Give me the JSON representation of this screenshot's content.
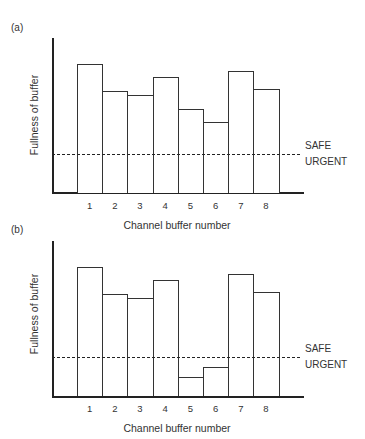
{
  "chart_data": [
    {
      "type": "bar",
      "panel": "(a)",
      "title": "",
      "xlabel": "Channel buffer number",
      "ylabel": "Fullness of buffer",
      "categories": [
        "1",
        "2",
        "3",
        "4",
        "5",
        "6",
        "7",
        "8"
      ],
      "values": [
        83,
        66,
        63,
        75,
        54,
        46,
        79,
        67
      ],
      "ylim": [
        0,
        100
      ],
      "grid": false,
      "threshold": {
        "value": 25,
        "style": "dashed",
        "label_above": "SAFE",
        "label_below": "URGENT"
      }
    },
    {
      "type": "bar",
      "panel": "(b)",
      "title": "",
      "xlabel": "Channel buffer number",
      "ylabel": "Fullness of buffer",
      "categories": [
        "1",
        "2",
        "3",
        "4",
        "5",
        "6",
        "7",
        "8"
      ],
      "values": [
        83,
        66,
        63,
        75,
        12,
        19,
        79,
        67
      ],
      "ylim": [
        0,
        100
      ],
      "grid": false,
      "threshold": {
        "value": 25,
        "style": "dashed",
        "label_above": "SAFE",
        "label_below": "URGENT"
      }
    }
  ],
  "panels": [
    {
      "label": "(a)",
      "ylabel": "Fullness of buffer",
      "xlabel": "Channel buffer number",
      "safe": "SAFE",
      "urgent": "URGENT",
      "ticks": [
        "1",
        "2",
        "3",
        "4",
        "5",
        "6",
        "7",
        "8"
      ]
    },
    {
      "label": "(b)",
      "ylabel": "Fullness of buffer",
      "xlabel": "Channel buffer number",
      "safe": "SAFE",
      "urgent": "URGENT",
      "ticks": [
        "1",
        "2",
        "3",
        "4",
        "5",
        "6",
        "7",
        "8"
      ]
    }
  ]
}
